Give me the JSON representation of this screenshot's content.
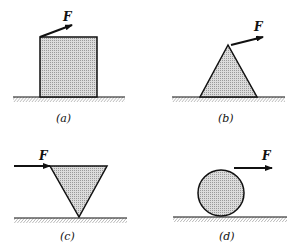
{
  "diagram": {
    "force_symbol": "F",
    "colors": {
      "stroke": "#111111",
      "fill": "#d4d4d4",
      "hatch": "#555555",
      "background": "#ffffff"
    },
    "panels": [
      {
        "id": "a",
        "caption": "(a)",
        "shape": "square",
        "force_label": "F",
        "force_application": "top-left corner, directed up-right"
      },
      {
        "id": "b",
        "caption": "(b)",
        "shape": "triangle",
        "force_label": "F",
        "force_application": "apex, directed up-right"
      },
      {
        "id": "c",
        "caption": "(c)",
        "shape": "inverted-triangle",
        "force_label": "F",
        "force_application": "top-left corner, directed horizontally right"
      },
      {
        "id": "d",
        "caption": "(d)",
        "shape": "circle",
        "force_label": "F",
        "force_application": "top of circle, directed horizontally right"
      }
    ]
  }
}
